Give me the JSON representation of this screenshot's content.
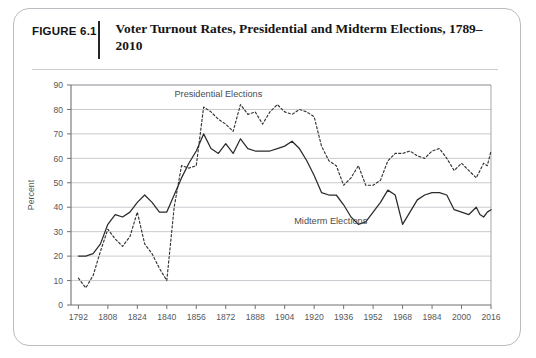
{
  "figure": {
    "number": "FIGURE 6.1",
    "title": "Voter Turnout Rates, Presidential and Midterm Elections, 1789–2010"
  },
  "chart_data": {
    "type": "line",
    "title": "Voter Turnout Rates, Presidential and Midterm Elections, 1789–2010",
    "xlabel": "",
    "ylabel": "Percent",
    "xlim": [
      1788,
      2016
    ],
    "ylim": [
      0,
      90
    ],
    "ytick_step": 10,
    "yticks": [
      0,
      10,
      20,
      30,
      40,
      50,
      60,
      70,
      80,
      90
    ],
    "xticks": [
      1792,
      1808,
      1824,
      1840,
      1856,
      1872,
      1888,
      1904,
      1920,
      1936,
      1952,
      1968,
      1984,
      2000,
      2016
    ],
    "grid": "horizontal",
    "legend_position": "inline-annotations",
    "series": [
      {
        "name": "Presidential Elections",
        "style": "dashed",
        "color": "#333333",
        "label_x": 1868,
        "label_y": 85,
        "points": [
          [
            1792,
            11
          ],
          [
            1796,
            7
          ],
          [
            1800,
            12
          ],
          [
            1804,
            22
          ],
          [
            1808,
            31
          ],
          [
            1812,
            27
          ],
          [
            1816,
            24
          ],
          [
            1820,
            28
          ],
          [
            1824,
            38
          ],
          [
            1828,
            25
          ],
          [
            1832,
            21
          ],
          [
            1836,
            15
          ],
          [
            1840,
            10
          ],
          [
            1844,
            40
          ],
          [
            1848,
            57
          ],
          [
            1852,
            56
          ],
          [
            1856,
            57
          ],
          [
            1860,
            81
          ],
          [
            1864,
            79
          ],
          [
            1868,
            76
          ],
          [
            1872,
            74
          ],
          [
            1876,
            71
          ],
          [
            1880,
            82
          ],
          [
            1884,
            78
          ],
          [
            1888,
            79
          ],
          [
            1892,
            74
          ],
          [
            1896,
            79
          ],
          [
            1900,
            82
          ],
          [
            1904,
            79
          ],
          [
            1908,
            78
          ],
          [
            1912,
            80
          ],
          [
            1916,
            79
          ],
          [
            1920,
            77
          ],
          [
            1924,
            65
          ],
          [
            1928,
            59
          ],
          [
            1932,
            57
          ],
          [
            1936,
            49
          ],
          [
            1940,
            52
          ],
          [
            1944,
            57
          ],
          [
            1948,
            49
          ],
          [
            1952,
            49
          ],
          [
            1956,
            51
          ],
          [
            1960,
            59
          ],
          [
            1964,
            62
          ],
          [
            1968,
            62
          ],
          [
            1972,
            63
          ],
          [
            1976,
            61
          ],
          [
            1980,
            60
          ],
          [
            1984,
            63
          ],
          [
            1988,
            64
          ],
          [
            1992,
            60
          ],
          [
            1996,
            55
          ],
          [
            2000,
            58
          ],
          [
            2004,
            55
          ],
          [
            2008,
            52
          ],
          [
            2010,
            55
          ],
          [
            2012,
            58
          ],
          [
            2014,
            57
          ],
          [
            2016,
            63
          ]
        ]
      },
      {
        "name": "Midterm Elections",
        "style": "solid",
        "color": "#2b2b2b",
        "label_x": 1929,
        "label_y": 33,
        "points": [
          [
            1792,
            20
          ],
          [
            1796,
            20
          ],
          [
            1800,
            21
          ],
          [
            1804,
            25
          ],
          [
            1808,
            33
          ],
          [
            1812,
            37
          ],
          [
            1816,
            36
          ],
          [
            1820,
            38
          ],
          [
            1824,
            42
          ],
          [
            1828,
            45
          ],
          [
            1832,
            42
          ],
          [
            1836,
            38
          ],
          [
            1840,
            38
          ],
          [
            1844,
            45
          ],
          [
            1848,
            52
          ],
          [
            1852,
            58
          ],
          [
            1856,
            63
          ],
          [
            1860,
            70
          ],
          [
            1864,
            64
          ],
          [
            1868,
            62
          ],
          [
            1872,
            66
          ],
          [
            1876,
            62
          ],
          [
            1880,
            68
          ],
          [
            1884,
            64
          ],
          [
            1888,
            63
          ],
          [
            1892,
            63
          ],
          [
            1896,
            63
          ],
          [
            1900,
            64
          ],
          [
            1904,
            65
          ],
          [
            1908,
            67
          ],
          [
            1912,
            64
          ],
          [
            1916,
            59
          ],
          [
            1920,
            53
          ],
          [
            1924,
            46
          ],
          [
            1928,
            45
          ],
          [
            1932,
            45
          ],
          [
            1936,
            41
          ],
          [
            1940,
            36
          ],
          [
            1944,
            33
          ],
          [
            1948,
            34
          ],
          [
            1952,
            38
          ],
          [
            1956,
            42
          ],
          [
            1960,
            47
          ],
          [
            1964,
            45
          ],
          [
            1968,
            33
          ],
          [
            1972,
            38
          ],
          [
            1976,
            43
          ],
          [
            1980,
            45
          ],
          [
            1984,
            46
          ],
          [
            1988,
            46
          ],
          [
            1992,
            45
          ],
          [
            1996,
            39
          ],
          [
            2000,
            38
          ],
          [
            2004,
            37
          ],
          [
            2008,
            40
          ],
          [
            2010,
            37
          ],
          [
            2012,
            36
          ],
          [
            2014,
            38
          ],
          [
            2016,
            39
          ]
        ]
      }
    ]
  }
}
